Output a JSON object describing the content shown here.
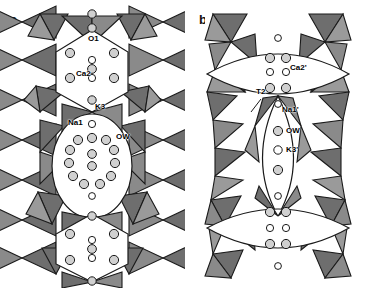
{
  "figure": {
    "type": "crystal-structure-polyhedral-diagram",
    "background": "#ffffff",
    "width": 371,
    "height": 288
  },
  "colors": {
    "tetrahedra_dark": "#6e6e6e",
    "tetrahedra_mid": "#8c8c8c",
    "tetrahedra_light": "#c9c9c9",
    "cavity_fill": "#ffffff",
    "outline": "#1a1a1a",
    "atom_fill": "#d0d0d0",
    "atom_open_fill": "#ffffff",
    "label_text": "#000000"
  },
  "panels": [
    {
      "id": "a",
      "label": "a",
      "label_x": 10,
      "label_y": 12,
      "cavity_shape": "hexagonal",
      "atom_labels": [
        {
          "name": "O1",
          "text": "O1",
          "x": 88,
          "y": 38
        },
        {
          "name": "Ca2",
          "text": "Ca2",
          "x": 78,
          "y": 70
        },
        {
          "name": "K3",
          "text": "K3",
          "x": 92,
          "y": 105
        },
        {
          "name": "Na1",
          "text": "Na1",
          "x": 68,
          "y": 120
        },
        {
          "name": "OW",
          "text": "OW",
          "x": 110,
          "y": 131
        }
      ]
    },
    {
      "id": "b",
      "label": "b",
      "label_x": 199,
      "label_y": 12,
      "cavity_shape": "lens",
      "atom_labels": [
        {
          "name": "Ca2prime",
          "text": "Ca2'",
          "x": 289,
          "y": 66
        },
        {
          "name": "T2",
          "text": "T2",
          "x": 258,
          "y": 93
        },
        {
          "name": "Na1prime",
          "text": "Na1'",
          "x": 282,
          "y": 106
        },
        {
          "name": "OW",
          "text": "OW",
          "x": 291,
          "y": 128
        },
        {
          "name": "K3prime",
          "text": "K3'",
          "x": 291,
          "y": 147
        }
      ]
    }
  ]
}
